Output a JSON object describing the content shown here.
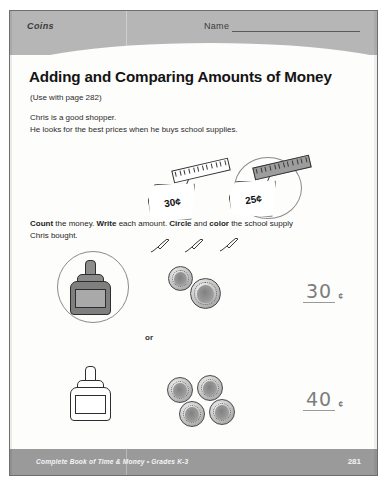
{
  "header": {
    "section_label": "Coins",
    "name_label": "Name"
  },
  "title": "Adding and Comparing Amounts of Money",
  "subtitle": "(Use with page 282)",
  "intro": {
    "line1": "Chris is a good shopper.",
    "line2": "He looks for the best prices when he buys school supplies."
  },
  "instructions": {
    "bold1": "Count",
    "text1": " the money. ",
    "bold2": "Write",
    "text2": " each amount. ",
    "bold3": "Circle",
    "text3": " and ",
    "bold4": "color",
    "text4": " the school supply",
    "line2": "Chris bought."
  },
  "shopping_example": {
    "items": [
      {
        "price_label": "30¢",
        "item": "ruler",
        "circled": false,
        "colored": false
      },
      {
        "price_label": "25¢",
        "item": "ruler",
        "circled": true,
        "colored": true
      }
    ]
  },
  "problems": [
    {
      "supply": "glue-bottle",
      "circled": true,
      "colored": true,
      "coins": [
        {
          "name": "dime",
          "value_cents": 10
        },
        {
          "name": "quarter",
          "value_cents": 25
        }
      ],
      "answer_value": "30",
      "answer_unit": "¢"
    },
    {
      "supply": "glue-bottle",
      "circled": false,
      "colored": false,
      "coins": [
        {
          "name": "dime",
          "value_cents": 10
        },
        {
          "name": "dime",
          "value_cents": 10
        },
        {
          "name": "dime",
          "value_cents": 10
        },
        {
          "name": "dime",
          "value_cents": 10
        }
      ],
      "answer_value": "40",
      "answer_unit": "¢"
    }
  ],
  "separator": "or",
  "footer": {
    "credit": "Complete Book of Time & Money  •  Grades K-3",
    "page_number": "281"
  },
  "colors": {
    "band": "#b6b6b6",
    "footer_band": "#9a9a9a",
    "ink": "#141414",
    "pencil_mark": "#8a8a8a"
  }
}
